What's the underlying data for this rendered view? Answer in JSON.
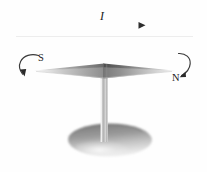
{
  "figure": {
    "background_color": "#fefefe",
    "width": 207,
    "height": 172
  },
  "labels": {
    "current": "I",
    "south_pole": "S",
    "north_pole": "N"
  },
  "elements": {
    "wire": {
      "name": "straight-current-carrying-wire",
      "x1": 14,
      "x2": 195,
      "y": 35,
      "color": "#8c8c8c"
    },
    "current_arrow": {
      "name": "current-direction-arrow",
      "x1": 66,
      "x2": 144,
      "y": 25,
      "direction": "right",
      "color": "#4a4a4a"
    },
    "needle": {
      "name": "compass-needle",
      "left_tip_x": 33,
      "right_tip_x": 176,
      "center_x": 104,
      "center_y": 71,
      "half_height": 8,
      "fill_light": "#d8d8d8",
      "fill_dark": "#6f6f6f"
    },
    "pivot_stem": {
      "name": "pivot-stem",
      "x": 104,
      "y_top": 76,
      "y_bottom": 140,
      "width": 7,
      "color": "#c9c9c9"
    },
    "base": {
      "name": "circular-base-stand",
      "center_x": 110,
      "center_y": 140,
      "rx": 42,
      "ry": 16,
      "fill_top": "#8e8e8e",
      "fill_bottom": "#e6e6e6"
    },
    "rotation_arrow_left": {
      "name": "rotation-arrow-south-side",
      "direction": "counterclockwise-down-left",
      "color": "#3a3a3a"
    },
    "rotation_arrow_right": {
      "name": "rotation-arrow-north-side",
      "direction": "clockwise-down-right",
      "color": "#3a3a3a"
    }
  },
  "colors": {
    "ink": "#1b1b1b",
    "metal_light": "#dcdcdc",
    "metal_mid": "#a8a8a8",
    "metal_dark": "#6a6a6a"
  }
}
